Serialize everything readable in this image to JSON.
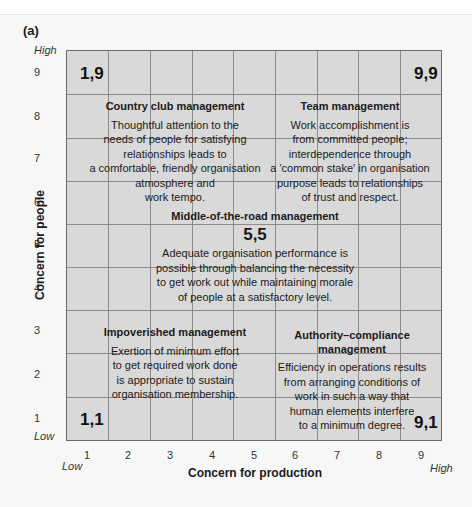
{
  "figure": {
    "panel_label": "(a)",
    "y_axis": {
      "label": "Concern for people",
      "high": "High",
      "low": "Low",
      "ticks": [
        "9",
        "8",
        "7",
        "6",
        "5",
        "4",
        "3",
        "2",
        "1"
      ]
    },
    "x_axis": {
      "label": "Concern for production",
      "high": "High",
      "low": "Low",
      "ticks": [
        "1",
        "2",
        "3",
        "4",
        "5",
        "6",
        "7",
        "8",
        "9"
      ]
    },
    "corners": {
      "c19": "1,9",
      "c99": "9,9",
      "c11": "1,1",
      "c91": "9,1",
      "c55": "5,5"
    },
    "styles": {
      "country_club": {
        "title": "Country club management",
        "lines": [
          "Thoughtful attention to the",
          "needs of people for satisfying",
          "relationships leads to",
          "a comfortable, friendly organisation",
          "atmosphere and",
          "work tempo."
        ]
      },
      "team": {
        "title": "Team management",
        "lines": [
          "Work accomplishment is",
          "from committed people;",
          "interdependence through",
          "a 'common stake' in organisation",
          "purpose leads to relationships",
          "of trust and respect."
        ]
      },
      "middle": {
        "title": "Middle-of-the-road management",
        "lines": [
          "Adequate organisation performance is",
          "possible through balancing the necessity",
          "to get work out while maintaining morale",
          "of people at a satisfactory level."
        ]
      },
      "impoverished": {
        "title": "Impoverished management",
        "lines": [
          "Exertion of minimum effort",
          "to get required work done",
          "is appropriate to sustain",
          "organisation membership."
        ]
      },
      "authority": {
        "title_line1": "Authority–compliance",
        "title_line2": "management",
        "lines": [
          "Efficiency in operations results",
          "from arranging conditions of",
          "work in such a way that",
          "human elements interfere",
          "to a minimum degree."
        ]
      }
    },
    "colors": {
      "grid_fill": "#d9d9d9",
      "grid_line": "#8c8c8c",
      "border": "#6a6a6a",
      "background": "#f7f7f7"
    }
  }
}
